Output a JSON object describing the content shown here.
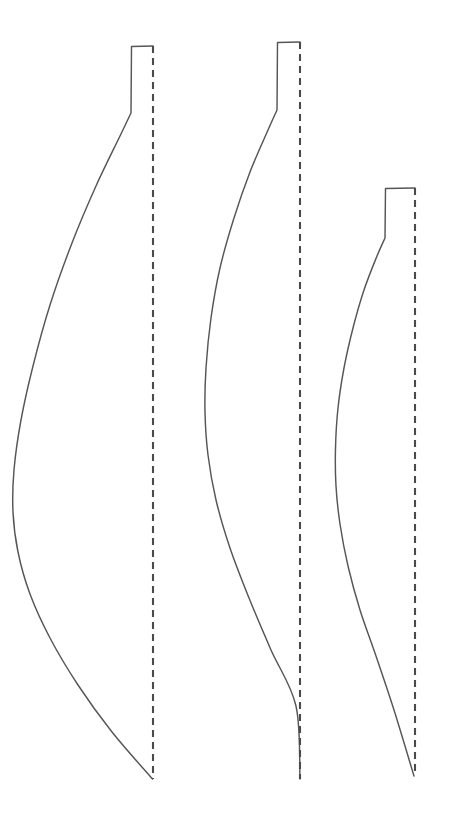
{
  "document": {
    "title": "Pattern Outline Diagram",
    "background_color": "#ffffff",
    "width": 451,
    "height": 828
  },
  "style": {
    "outline_stroke_color": "#565656",
    "fold_line_color": "#4a4a4a",
    "outline_stroke_width": 1.45,
    "fold_line_stroke_width": 2.1,
    "fold_dash_pattern": "7 5"
  },
  "footer": {
    "caption": ""
  },
  "chart_data": {
    "type": "line",
    "subtitle": "",
    "xlabel": "",
    "ylabel": "",
    "grid": false,
    "legend": "none",
    "xlim": [
      0,
      451
    ],
    "ylim": [
      828,
      0
    ],
    "annotations": [],
    "series": [
      {
        "name": "blade-1-outline",
        "label": "Large blade outline (left)",
        "kind": "closed-outline",
        "points": [
          [
            153.0,
            46.0
          ],
          [
            131.5,
            46.5
          ],
          [
            131.0,
            113.0
          ],
          [
            120.0,
            136.0
          ],
          [
            96.0,
            186.0
          ],
          [
            72.0,
            243.0
          ],
          [
            50.0,
            305.0
          ],
          [
            33.0,
            366.0
          ],
          [
            21.0,
            420.0
          ],
          [
            14.0,
            470.0
          ],
          [
            13.0,
            512.0
          ],
          [
            18.0,
            552.0
          ],
          [
            30.0,
            594.0
          ],
          [
            50.0,
            638.0
          ],
          [
            78.0,
            685.0
          ],
          [
            112.0,
            732.0
          ],
          [
            152.5,
            779.0
          ]
        ]
      },
      {
        "name": "blade-1-fold",
        "label": "Large blade fold line (left)",
        "kind": "dashed-vertical",
        "x": 153.0,
        "y_top": 46.0,
        "y_bottom": 779.0
      },
      {
        "name": "blade-2-outline",
        "label": "Medium blade outline (center)",
        "kind": "closed-outline",
        "points": [
          [
            300.0,
            42.0
          ],
          [
            277.5,
            42.5
          ],
          [
            277.0,
            110.0
          ],
          [
            268.0,
            130.0
          ],
          [
            250.0,
            172.0
          ],
          [
            234.0,
            218.0
          ],
          [
            220.0,
            268.0
          ],
          [
            211.0,
            318.0
          ],
          [
            206.0,
            368.0
          ],
          [
            205.0,
            412.0
          ],
          [
            208.0,
            455.0
          ],
          [
            216.0,
            500.0
          ],
          [
            230.0,
            548.0
          ],
          [
            249.0,
            598.0
          ],
          [
            271.0,
            650.0
          ],
          [
            296.0,
            706.0
          ],
          [
            300.0,
            779.0
          ]
        ]
      },
      {
        "name": "blade-2-fold",
        "label": "Medium blade fold line (center)",
        "kind": "dashed-vertical",
        "x": 300.0,
        "y_top": 42.0,
        "y_bottom": 779.0
      },
      {
        "name": "blade-3-outline",
        "label": "Small blade outline (right)",
        "kind": "closed-outline",
        "points": [
          [
            415.0,
            188.0
          ],
          [
            385.5,
            188.5
          ],
          [
            385.0,
            238.0
          ],
          [
            377.0,
            256.0
          ],
          [
            364.0,
            290.0
          ],
          [
            353.0,
            328.0
          ],
          [
            344.0,
            368.0
          ],
          [
            338.0,
            408.0
          ],
          [
            335.5,
            448.0
          ],
          [
            336.0,
            486.0
          ],
          [
            340.0,
            524.0
          ],
          [
            348.0,
            566.0
          ],
          [
            360.0,
            610.0
          ],
          [
            376.0,
            656.0
          ],
          [
            394.0,
            710.0
          ],
          [
            414.0,
            776.0
          ]
        ]
      },
      {
        "name": "blade-3-fold",
        "label": "Small blade fold line (right)",
        "kind": "dashed-vertical",
        "x": 415.0,
        "y_top": 188.0,
        "y_bottom": 776.0
      }
    ]
  }
}
